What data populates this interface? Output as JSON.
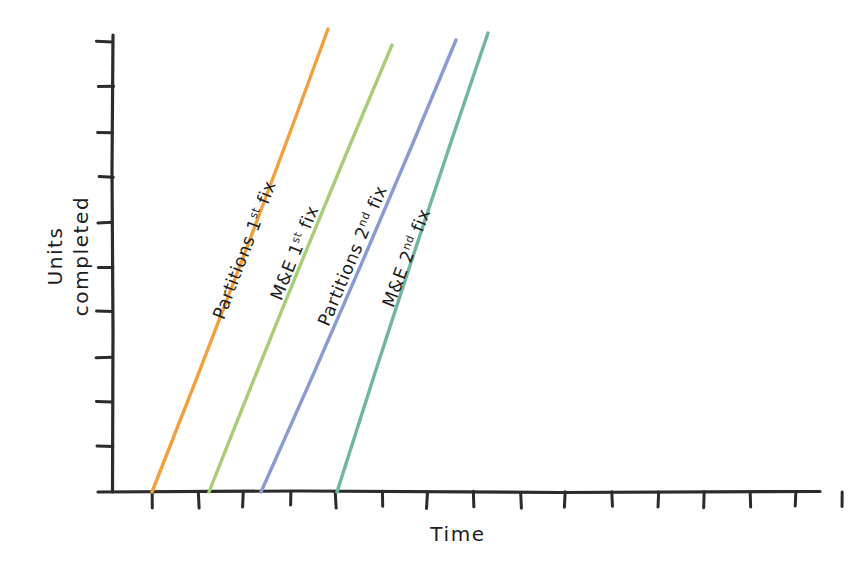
{
  "chart_data": {
    "type": "line",
    "title": "",
    "xlabel": "Time",
    "ylabel": "Units completed",
    "ylabel_line1": "Units",
    "ylabel_line2": "completed",
    "style": "hand-drawn sketch",
    "grid": false,
    "legend": "inline labels along each line",
    "axis_ticks": {
      "x_tick_count": 16,
      "y_tick_count": 10,
      "x_tick_labels": [],
      "y_tick_labels": []
    },
    "xlim": [
      0,
      16
    ],
    "ylim": [
      0,
      10
    ],
    "note": "Four parallel production lines showing cumulative units completed over time; each trade starts after a fixed lag from the previous one.",
    "series": [
      {
        "name": "Partitions 1st fix",
        "label_main": "Partitions",
        "label_ordinal_num": "1",
        "label_ordinal_suffix": "st",
        "label_tail": "fix",
        "color": "#f2a03f",
        "start": {
          "x": 152,
          "y": 492
        },
        "end": {
          "x": 328,
          "y": 29
        },
        "label_anchor": {
          "x": 250,
          "y": 252
        },
        "label_rotation": -69
      },
      {
        "name": "M&E 1st fix",
        "label_main": "M&E",
        "label_ordinal_num": "1",
        "label_ordinal_suffix": "st",
        "label_tail": "fix",
        "color": "#a8cc78",
        "start": {
          "x": 209,
          "y": 492
        },
        "end": {
          "x": 392,
          "y": 45
        },
        "label_anchor": {
          "x": 300,
          "y": 255
        },
        "label_rotation": -68
      },
      {
        "name": "Partitions 2nd fix",
        "label_main": "Partitions",
        "label_ordinal_num": "2",
        "label_ordinal_suffix": "nd",
        "label_tail": "fix",
        "color": "#8b9ad0",
        "start": {
          "x": 261,
          "y": 492
        },
        "end": {
          "x": 456,
          "y": 40
        },
        "label_anchor": {
          "x": 358,
          "y": 258
        },
        "label_rotation": -67
      },
      {
        "name": "M&E 2nd fix",
        "label_main": "M&E",
        "label_ordinal_num": "2",
        "label_ordinal_suffix": "nd",
        "label_tail": "fix",
        "color": "#6fb5a2",
        "start": {
          "x": 337,
          "y": 492
        },
        "end": {
          "x": 488,
          "y": 33
        },
        "label_anchor": {
          "x": 412,
          "y": 260
        },
        "label_rotation": -69
      }
    ],
    "colors": {
      "axis": "#2b2b2b",
      "text": "#1d1d1d",
      "background": "#ffffff",
      "partitions_1st": "#f2a03f",
      "me_1st": "#a8cc78",
      "partitions_2nd": "#8b9ad0",
      "me_2nd": "#6fb5a2"
    },
    "geometry": {
      "axis_origin": {
        "x": 113,
        "y": 492
      },
      "y_axis_top": {
        "x": 113,
        "y": 35
      },
      "x_axis_right": {
        "x": 820,
        "y": 492
      },
      "x_tick_start": 152,
      "x_tick_step": 46,
      "y_tick_start": 42,
      "y_tick_step": 45,
      "tick_len_x": 15,
      "tick_len_y": 15
    }
  }
}
